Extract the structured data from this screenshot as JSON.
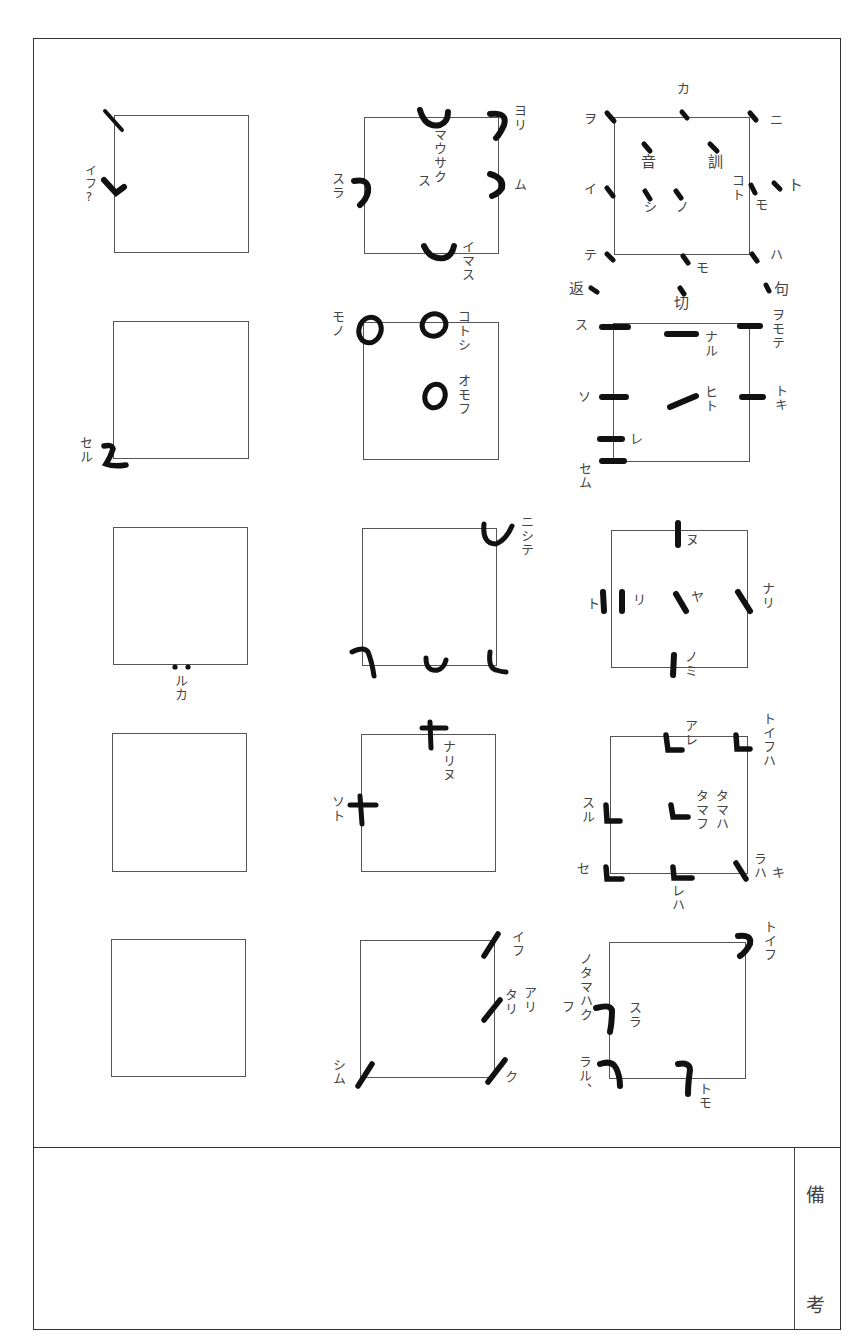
{
  "document": {
    "type": "ヲコト点 (okoto-ten) reading-mark chart",
    "remarks_label": [
      "備",
      "考"
    ],
    "remarks_content": ""
  },
  "grid": {
    "columns": 3,
    "rows": 5,
    "cells": [
      {
        "id": "r1c1",
        "labels": [
          {
            "text": "イフ?",
            "pos": "left"
          }
        ],
        "marks": [
          "slash-top-left",
          "hook-left-mid"
        ]
      },
      {
        "id": "r1c2",
        "labels": [
          {
            "text": "ヨリ",
            "pos": "top-right"
          },
          {
            "text": "マウサク",
            "pos": "center"
          },
          {
            "text": "ス",
            "pos": "center-left"
          },
          {
            "text": "スラ",
            "pos": "left"
          },
          {
            "text": "ム",
            "pos": "right"
          },
          {
            "text": "イマス",
            "pos": "bottom-right"
          }
        ],
        "marks": [
          "cup-top",
          "hook-top-right",
          "hook-left",
          "hook-right",
          "cup-bottom"
        ]
      },
      {
        "id": "r1c3",
        "labels": [
          {
            "text": "カ",
            "pos": "top"
          },
          {
            "text": "ヲ",
            "pos": "top-left"
          },
          {
            "text": "ニ",
            "pos": "top-right"
          },
          {
            "text": "音",
            "pos": "inner-upper-left"
          },
          {
            "text": "訓",
            "pos": "inner-upper-right"
          },
          {
            "text": "イ",
            "pos": "left"
          },
          {
            "text": "シ",
            "pos": "inner-lower-left"
          },
          {
            "text": "ノ",
            "pos": "inner-lower-mid"
          },
          {
            "text": "コト",
            "pos": "inner-right"
          },
          {
            "text": "モ",
            "pos": "right"
          },
          {
            "text": "ト",
            "pos": "outer-right"
          },
          {
            "text": "テ",
            "pos": "bottom-left"
          },
          {
            "text": "モ",
            "pos": "bottom"
          },
          {
            "text": "ハ",
            "pos": "bottom-right"
          },
          {
            "text": "返",
            "pos": "below-left"
          },
          {
            "text": "切",
            "pos": "below"
          },
          {
            "text": "句",
            "pos": "below-right"
          }
        ],
        "marks": [
          "dots"
        ]
      },
      {
        "id": "r2c1",
        "labels": [
          {
            "text": "セル",
            "pos": "bottom-left"
          }
        ],
        "marks": [
          "z-stroke"
        ]
      },
      {
        "id": "r2c2",
        "labels": [
          {
            "text": "モノ",
            "pos": "top-left"
          },
          {
            "text": "コトシ",
            "pos": "top-right"
          },
          {
            "text": "オモフ",
            "pos": "right-mid"
          }
        ],
        "marks": [
          "circle-top-left",
          "circle-top",
          "circle-center"
        ]
      },
      {
        "id": "r2c3",
        "labels": [
          {
            "text": "ス",
            "pos": "top-left"
          },
          {
            "text": "ナル",
            "pos": "inner-top"
          },
          {
            "text": "ヲモテ",
            "pos": "top-right"
          },
          {
            "text": "ソ",
            "pos": "left"
          },
          {
            "text": "ヒト",
            "pos": "center"
          },
          {
            "text": "トキ",
            "pos": "right"
          },
          {
            "text": "レ",
            "pos": "lower-left"
          },
          {
            "text": "セム",
            "pos": "bottom-left"
          }
        ],
        "marks": [
          "bars"
        ]
      },
      {
        "id": "r3c1",
        "labels": [
          {
            "text": "ルカ",
            "pos": "bottom"
          }
        ],
        "marks": [
          "double-dot-bottom"
        ]
      },
      {
        "id": "r3c2",
        "labels": [
          {
            "text": "ニシテ",
            "pos": "top-right"
          }
        ],
        "marks": [
          "cup-top-right",
          "hook-bottom-left",
          "cup-bottom",
          "hook-bottom-right"
        ]
      },
      {
        "id": "r3c3",
        "labels": [
          {
            "text": "ヌ",
            "pos": "top"
          },
          {
            "text": "ト",
            "pos": "left-outer"
          },
          {
            "text": "リ",
            "pos": "left-inner"
          },
          {
            "text": "ヤ",
            "pos": "center"
          },
          {
            "text": "ナリ",
            "pos": "right"
          },
          {
            "text": "ノミ",
            "pos": "bottom"
          }
        ],
        "marks": [
          "vertical-bars",
          "diagonal-strokes"
        ]
      },
      {
        "id": "r4c1",
        "labels": [],
        "marks": []
      },
      {
        "id": "r4c2",
        "labels": [
          {
            "text": "ナリヌ",
            "pos": "top"
          },
          {
            "text": "ソト",
            "pos": "left"
          }
        ],
        "marks": [
          "cross-top",
          "cross-left"
        ]
      },
      {
        "id": "r4c3",
        "labels": [
          {
            "text": "アレ",
            "pos": "top"
          },
          {
            "text": "トイフハ",
            "pos": "top-right"
          },
          {
            "text": "スル",
            "pos": "left"
          },
          {
            "text": "タマフ",
            "pos": "center"
          },
          {
            "text": "タマハ",
            "pos": "center-right"
          },
          {
            "text": "セ",
            "pos": "bottom-left"
          },
          {
            "text": "レハ",
            "pos": "bottom"
          },
          {
            "text": "ラハ",
            "pos": "bottom-right"
          },
          {
            "text": "キ",
            "pos": "bottom-right-outer"
          }
        ],
        "marks": [
          "L-strokes"
        ]
      },
      {
        "id": "r5c1",
        "labels": [],
        "marks": []
      },
      {
        "id": "r5c2",
        "labels": [
          {
            "text": "イフ",
            "pos": "top-right"
          },
          {
            "text": "アリ",
            "pos": "right-mid"
          },
          {
            "text": "タリ",
            "pos": "right-mid-inner"
          },
          {
            "text": "シム",
            "pos": "bottom-left"
          },
          {
            "text": "ク",
            "pos": "bottom-right"
          }
        ],
        "marks": [
          "slant-strokes"
        ]
      },
      {
        "id": "r5c3",
        "labels": [
          {
            "text": "トイフ",
            "pos": "top-right"
          },
          {
            "text": "ノタマハク",
            "pos": "left"
          },
          {
            "text": "フ",
            "pos": "left-outer"
          },
          {
            "text": "スラ",
            "pos": "left-inner"
          },
          {
            "text": "ラル、",
            "pos": "bottom-left"
          },
          {
            "text": "トモ",
            "pos": "bottom"
          }
        ],
        "marks": [
          "hook-strokes"
        ]
      }
    ]
  },
  "text": {
    "r1c1_a": "イフ?",
    "r1c2_yori": "ヨリ",
    "r1c2_mausaku": "マウサク",
    "r1c2_su": "ス",
    "r1c2_sura": "スラ",
    "r1c2_mu": "ム",
    "r1c2_imasu": "イマス",
    "r1c3_ka": "カ",
    "r1c3_wo": "ヲ",
    "r1c3_ni": "ニ",
    "r1c3_on": "音",
    "r1c3_kun": "訓",
    "r1c3_i": "イ",
    "r1c3_shi": "シ",
    "r1c3_no": "ノ",
    "r1c3_koto": "コト",
    "r1c3_mo": "モ",
    "r1c3_to": "ト",
    "r1c3_te": "テ",
    "r1c3_mo2": "モ",
    "r1c3_ha": "ハ",
    "r1c3_kaeri": "返",
    "r1c3_kiri": "切",
    "r1c3_ku": "句",
    "r2c1_seru": "セル",
    "r2c2_mono": "モノ",
    "r2c2_kotoshi": "コトシ",
    "r2c2_omofu": "オモフ",
    "r2c3_su": "ス",
    "r2c3_naru": "ナル",
    "r2c3_womote": "ヲモテ",
    "r2c3_so": "ソ",
    "r2c3_hito": "ヒト",
    "r2c3_toki": "トキ",
    "r2c3_re": "レ",
    "r2c3_semu": "セム",
    "r3c1_ruka": "ルカ",
    "r3c2_nishite": "ニシテ",
    "r3c3_nu": "ヌ",
    "r3c3_to": "ト",
    "r3c3_ri": "リ",
    "r3c3_ya": "ヤ",
    "r3c3_nari": "ナリ",
    "r3c3_nomi": "ノミ",
    "r4c2_narinu": "ナリヌ",
    "r4c2_soto": "ソト",
    "r4c3_are": "アレ",
    "r4c3_toifuha": "トイフハ",
    "r4c3_suru": "スル",
    "r4c3_tamafu": "タマフ",
    "r4c3_tamaha": "タマハ",
    "r4c3_se": "セ",
    "r4c3_reha": "レハ",
    "r4c3_raha": "ラハ",
    "r4c3_ki": "キ",
    "r5c2_ifu": "イフ",
    "r5c2_ari": "アリ",
    "r5c2_tari": "タリ",
    "r5c2_shimu": "シム",
    "r5c2_ku": "ク",
    "r5c3_toifu": "トイフ",
    "r5c3_notamahaku": "ノタマハク",
    "r5c3_fu": "フ",
    "r5c3_sura": "スラ",
    "r5c3_raru": "ラル、",
    "r5c3_tomo": "トモ",
    "remarks_1": "備",
    "remarks_2": "考"
  }
}
